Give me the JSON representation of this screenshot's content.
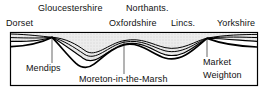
{
  "figure": {
    "type": "geological-cross-section",
    "title_present": false,
    "orientation": "south-west to north-east across England",
    "frame": {
      "x": 10,
      "y": 32,
      "width": 248,
      "height": 54,
      "border_color": "#000000"
    },
    "fill_color": "#e9e9e9",
    "line_color": "#000000",
    "background": "#ffffff"
  },
  "county_labels": {
    "row_upper": [
      {
        "text": "Gloucestershire",
        "x": 38,
        "y": 4
      },
      {
        "text": "Northants.",
        "x": 126,
        "y": 4
      }
    ],
    "row_lower": [
      {
        "text": "Dorset",
        "x": 6,
        "y": 19
      },
      {
        "text": "Oxfordshire",
        "x": 109,
        "y": 19
      },
      {
        "text": "Lincs.",
        "x": 171,
        "y": 19
      },
      {
        "text": "Yorkshire",
        "x": 217,
        "y": 19
      }
    ]
  },
  "feature_labels": [
    {
      "text": "Mendips",
      "x": 26,
      "y": 66,
      "leader_from_x": 52,
      "leader_from_y": 37,
      "leader_to_x": 52,
      "leader_to_y": 63
    },
    {
      "text": "Moreton-in-the-Marsh",
      "x": 79,
      "y": 77,
      "leader_from_x": 124,
      "leader_from_y": 40,
      "leader_to_x": 124,
      "leader_to_y": 74
    },
    {
      "text": "Market",
      "x": 203,
      "y": 60,
      "leader_from_x": 207,
      "leader_from_y": 38,
      "leader_to_x": 207,
      "leader_to_y": 57
    },
    {
      "text": "Weighton",
      "x": 203,
      "y": 73
    }
  ],
  "strata": {
    "layer_count": 4,
    "anticlines": [
      {
        "name": "Mendips",
        "x": 52
      },
      {
        "name": "Market Weighton",
        "x": 207
      }
    ],
    "synclines": [
      {
        "name": "Moreton-in-the-Marsh basin",
        "x": 85,
        "depth": "deep"
      },
      {
        "name": "Lincolnshire basin",
        "x": 165,
        "depth": "shallow"
      }
    ]
  }
}
